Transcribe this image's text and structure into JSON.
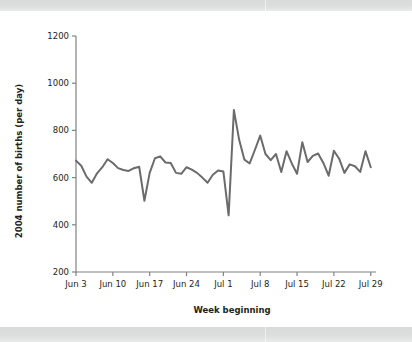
{
  "figure": {
    "background_color": "#ffffff",
    "band_color": "#dcdddd",
    "line_color": "#6b6b6b",
    "axis_color": "#808285",
    "text_color": "#231f20"
  },
  "chart_data": {
    "type": "line",
    "title": "",
    "subtitle": "",
    "xlabel": "Week beginning",
    "ylabel": "2004 number of births (per day)",
    "xlim": [
      0,
      57
    ],
    "ylim": [
      200,
      1200
    ],
    "grid": false,
    "legend": null,
    "legend_position": "none",
    "y_ticks": [
      200,
      400,
      600,
      800,
      1000,
      1200
    ],
    "y_tick_labels": [
      "200",
      "400",
      "600",
      "800",
      "1000",
      "1200"
    ],
    "x_ticks": [
      0,
      7,
      14,
      21,
      28,
      35,
      42,
      49,
      56
    ],
    "x_tick_labels": [
      "Jun 3",
      "Jun 10",
      "Jun 17",
      "Jun 24",
      "Jul 1",
      "Jul 8",
      "Jul 15",
      "Jul 22",
      "Jul 29"
    ],
    "series": [
      {
        "name": "2004 number of births (per day)",
        "color": "#6b6b6b",
        "x": [
          0,
          1,
          2,
          3,
          4,
          5,
          6,
          7,
          8,
          9,
          10,
          11,
          12,
          13,
          14,
          15,
          16,
          17,
          18,
          19,
          20,
          21,
          22,
          23,
          24,
          25,
          26,
          27,
          28,
          29,
          30,
          31,
          32,
          33,
          34,
          35,
          36,
          37,
          38,
          39,
          40,
          41,
          42,
          43,
          44,
          45,
          46,
          47,
          48,
          49,
          50,
          51,
          52,
          53,
          54,
          55,
          56
        ],
        "values": [
          672,
          650,
          604,
          578,
          618,
          644,
          678,
          662,
          640,
          632,
          628,
          640,
          646,
          502,
          620,
          682,
          690,
          664,
          662,
          620,
          616,
          644,
          634,
          620,
          600,
          578,
          612,
          630,
          626,
          440,
          886,
          760,
          676,
          660,
          718,
          778,
          700,
          674,
          700,
          624,
          712,
          660,
          616,
          750,
          666,
          692,
          702,
          662,
          608,
          714,
          680,
          620,
          656,
          648,
          624,
          712,
          644
        ]
      }
    ]
  }
}
